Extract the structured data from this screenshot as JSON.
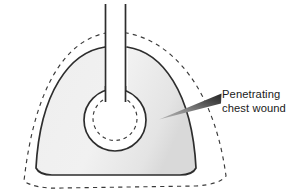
{
  "figure": {
    "background_color": "#ffffff",
    "width": 296,
    "height": 196
  },
  "callout": {
    "line1": "Penetrating",
    "line2": "chest wound",
    "text_color": "#1a1a1a",
    "arrow": {
      "name": "leader-wedge-arrow",
      "tip_x": 159,
      "tip_y": 119,
      "tail_x": 221,
      "tail_y": 97,
      "gradient_from": "#9a9a9a",
      "gradient_to": "#2b2b2b"
    }
  },
  "anatomy": {
    "collapsed_lung": {
      "name": "collapsed-lung-shape",
      "fill": "#ededed",
      "stroke": "#2d2d2d",
      "stroke_width": 1.6,
      "description": "Dome shaped lung with concave inferior border"
    },
    "normal_outline": {
      "name": "normal-lung-dashed-outline",
      "stroke": "#3a3a3a",
      "stroke_width": 1.2,
      "dash": "4 4",
      "description": "Dashed outline showing normal lung position"
    },
    "airway": {
      "name": "bronchus-airway-channel",
      "fill": "#ffffff",
      "stroke": "#2d2d2d",
      "stroke_width": 1.6,
      "description": "Vertical airway running from superior edge to wound cavity"
    },
    "wound_cavity": {
      "name": "wound-cavity-circle",
      "cx": 115,
      "cy": 120,
      "r": 31,
      "fill": "#ffffff",
      "stroke": "#2d2d2d",
      "stroke_width": 1.6
    },
    "wound_inner": {
      "name": "wound-inner-dashed-circle",
      "cx": 115,
      "cy": 121,
      "r": 22,
      "stroke": "#3a3a3a",
      "stroke_width": 1.2,
      "dash": "3.5 3.5"
    }
  }
}
